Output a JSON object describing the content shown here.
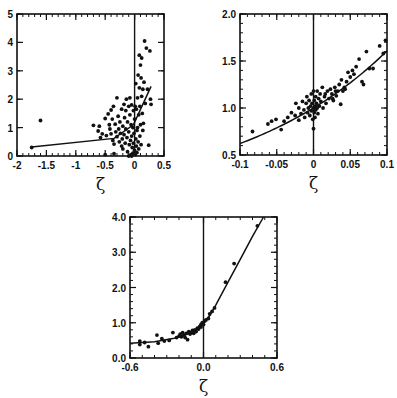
{
  "figure": {
    "width": 397,
    "height": 398,
    "ink_color": "#111111",
    "background": "#ffffff"
  },
  "chart_data": [
    {
      "type": "scatter",
      "panel": "top-left",
      "title": "",
      "xlabel": "ζ",
      "ylabel": "",
      "xlim": [
        -2,
        0.5
      ],
      "ylim": [
        0,
        5
      ],
      "xticks": [
        -2,
        -1.5,
        -1,
        -0.5,
        0,
        0.5
      ],
      "xtick_labels": [
        "-2",
        "-1.5",
        "-1",
        "-0.5",
        "0",
        "0.5"
      ],
      "xminor_step": 0.1,
      "yticks": [
        0,
        1,
        2,
        3,
        4,
        5
      ],
      "ytick_labels": [
        "0",
        "1",
        "2",
        "3",
        "4",
        "5"
      ],
      "yminor_step": 1,
      "grid": false,
      "vline_x": 0,
      "frame_px": {
        "x0": 17,
        "y0": 14,
        "x1": 164,
        "y1": 156
      },
      "fit_line": [
        [
          -1.75,
          0.32
        ],
        [
          -0.35,
          0.62
        ],
        [
          -0.02,
          1.1
        ],
        [
          0.28,
          2.45
        ]
      ],
      "points": [
        [
          -1.75,
          0.3
        ],
        [
          -1.6,
          1.25
        ],
        [
          -0.7,
          1.08
        ],
        [
          -0.62,
          0.88
        ],
        [
          -0.6,
          1.05
        ],
        [
          -0.58,
          0.65
        ],
        [
          -0.55,
          0.78
        ],
        [
          -0.5,
          1.32
        ],
        [
          -0.48,
          0.72
        ],
        [
          -0.45,
          1.48
        ],
        [
          -0.43,
          1.1
        ],
        [
          -0.42,
          0.95
        ],
        [
          -0.4,
          0.78
        ],
        [
          -0.4,
          1.62
        ],
        [
          -0.38,
          1.3
        ],
        [
          -0.37,
          0.55
        ],
        [
          -0.36,
          1.75
        ],
        [
          -0.35,
          0.42
        ],
        [
          -0.33,
          1.12
        ],
        [
          -0.32,
          0.85
        ],
        [
          -0.3,
          2.05
        ],
        [
          -0.3,
          0.68
        ],
        [
          -0.28,
          1.4
        ],
        [
          -0.27,
          0.95
        ],
        [
          -0.26,
          0.5
        ],
        [
          -0.25,
          1.2
        ],
        [
          -0.24,
          0.8
        ],
        [
          -0.22,
          1.65
        ],
        [
          -0.22,
          0.35
        ],
        [
          -0.21,
          0.6
        ],
        [
          -0.2,
          1.05
        ],
        [
          -0.2,
          0.25
        ],
        [
          -0.18,
          1.82
        ],
        [
          -0.18,
          0.75
        ],
        [
          -0.17,
          1.35
        ],
        [
          -0.16,
          0.45
        ],
        [
          -0.15,
          1.6
        ],
        [
          -0.15,
          0.95
        ],
        [
          -0.14,
          2.0
        ],
        [
          -0.13,
          0.65
        ],
        [
          -0.12,
          1.2
        ],
        [
          -0.12,
          0.15
        ],
        [
          -0.1,
          1.75
        ],
        [
          -0.1,
          0.85
        ],
        [
          -0.09,
          0.4
        ],
        [
          -0.08,
          2.05
        ],
        [
          -0.08,
          1.45
        ],
        [
          -0.07,
          0.55
        ],
        [
          -0.06,
          1.1
        ],
        [
          -0.06,
          0.05
        ],
        [
          -0.05,
          0.7
        ],
        [
          -0.05,
          1.8
        ],
        [
          -0.04,
          0.3
        ],
        [
          -0.03,
          1.0
        ],
        [
          -0.03,
          0.1
        ],
        [
          -0.02,
          1.6
        ],
        [
          -0.02,
          0.45
        ],
        [
          -0.01,
          0.8
        ],
        [
          0.0,
          0.2
        ],
        [
          0.0,
          1.3
        ],
        [
          0.01,
          0.05
        ],
        [
          0.01,
          1.75
        ],
        [
          0.02,
          0.6
        ],
        [
          0.02,
          2.55
        ],
        [
          0.03,
          0.35
        ],
        [
          0.03,
          1.65
        ],
        [
          0.04,
          0.9
        ],
        [
          0.04,
          0.12
        ],
        [
          0.05,
          2.05
        ],
        [
          0.05,
          1.0
        ],
        [
          0.06,
          0.5
        ],
        [
          0.06,
          2.85
        ],
        [
          0.07,
          1.45
        ],
        [
          0.07,
          0.25
        ],
        [
          0.08,
          3.55
        ],
        [
          0.08,
          2.4
        ],
        [
          0.09,
          1.75
        ],
        [
          0.09,
          0.7
        ],
        [
          0.1,
          3.2
        ],
        [
          0.1,
          1.1
        ],
        [
          0.11,
          2.75
        ],
        [
          0.11,
          0.4
        ],
        [
          0.12,
          3.45
        ],
        [
          0.12,
          2.1
        ],
        [
          0.13,
          1.5
        ],
        [
          0.14,
          2.35
        ],
        [
          0.14,
          0.9
        ],
        [
          0.15,
          1.15
        ],
        [
          0.16,
          2.6
        ],
        [
          0.17,
          4.05
        ],
        [
          0.18,
          1.85
        ],
        [
          0.2,
          3.8
        ],
        [
          0.22,
          2.35
        ],
        [
          0.24,
          0.38
        ],
        [
          0.26,
          3.7
        ],
        [
          0.27,
          2.0
        ],
        [
          0.28,
          1.82
        ],
        [
          -0.05,
          0.0
        ],
        [
          -0.1,
          0.0
        ],
        [
          -0.5,
          0.05
        ],
        [
          -0.35,
          0.08
        ]
      ]
    },
    {
      "type": "scatter",
      "panel": "top-right",
      "title": "",
      "xlabel": "ζ",
      "ylabel": "",
      "xlim": [
        -0.1,
        0.1
      ],
      "ylim": [
        0.5,
        2.0
      ],
      "xticks": [
        -0.1,
        -0.05,
        0,
        0.05,
        0.1
      ],
      "xtick_labels": [
        "-0.1",
        "-0.05",
        "0",
        "0.05",
        "0.1"
      ],
      "xminor_step": 0.01,
      "yticks": [
        0.5,
        1.0,
        1.5,
        2.0
      ],
      "ytick_labels": [
        "0.5",
        "1.0",
        "1.5",
        "2.0"
      ],
      "yminor_step": 0.1,
      "grid": false,
      "vline_x": 0,
      "frame_px": {
        "x0": 240,
        "y0": 14,
        "x1": 387,
        "y1": 155
      },
      "fit_curve": {
        "form": "exp",
        "a": 1.0,
        "b": 4.75,
        "x_from": -0.1,
        "x_to": 0.1
      },
      "points": [
        [
          -0.083,
          0.75
        ],
        [
          -0.062,
          0.83
        ],
        [
          -0.057,
          0.86
        ],
        [
          -0.051,
          0.88
        ],
        [
          -0.044,
          0.77
        ],
        [
          -0.04,
          0.86
        ],
        [
          -0.035,
          0.9
        ],
        [
          -0.03,
          0.95
        ],
        [
          -0.025,
          0.92
        ],
        [
          -0.02,
          1.0
        ],
        [
          -0.02,
          0.87
        ],
        [
          -0.017,
          0.94
        ],
        [
          -0.015,
          1.07
        ],
        [
          -0.013,
          0.98
        ],
        [
          -0.012,
          0.9
        ],
        [
          -0.01,
          1.05
        ],
        [
          -0.009,
          1.12
        ],
        [
          -0.008,
          0.95
        ],
        [
          -0.007,
          1.0
        ],
        [
          -0.006,
          1.08
        ],
        [
          -0.005,
          0.92
        ],
        [
          -0.004,
          1.02
        ],
        [
          -0.003,
          1.15
        ],
        [
          -0.003,
          0.97
        ],
        [
          -0.002,
          1.05
        ],
        [
          -0.001,
          0.88
        ],
        [
          0.0,
          1.0
        ],
        [
          0.0,
          0.78
        ],
        [
          0.0,
          1.18
        ],
        [
          0.001,
          0.95
        ],
        [
          0.001,
          1.08
        ],
        [
          0.002,
          1.02
        ],
        [
          0.002,
          0.9
        ],
        [
          0.003,
          1.12
        ],
        [
          0.003,
          0.98
        ],
        [
          0.004,
          1.05
        ],
        [
          0.005,
          1.0
        ],
        [
          0.005,
          1.18
        ],
        [
          0.006,
          0.94
        ],
        [
          0.007,
          1.1
        ],
        [
          0.008,
          1.02
        ],
        [
          0.009,
          1.15
        ],
        [
          0.01,
          1.07
        ],
        [
          0.012,
          1.22
        ],
        [
          0.013,
          1.0
        ],
        [
          0.015,
          1.12
        ],
        [
          0.017,
          1.05
        ],
        [
          0.019,
          1.18
        ],
        [
          0.021,
          1.1
        ],
        [
          0.023,
          1.2
        ],
        [
          0.025,
          1.15
        ],
        [
          0.027,
          1.08
        ],
        [
          0.029,
          1.22
        ],
        [
          0.031,
          1.13
        ],
        [
          0.033,
          1.18
        ],
        [
          0.035,
          1.25
        ],
        [
          0.037,
          1.04
        ],
        [
          0.038,
          1.3
        ],
        [
          0.04,
          1.18
        ],
        [
          0.042,
          1.22
        ],
        [
          0.045,
          1.28
        ],
        [
          0.047,
          1.38
        ],
        [
          0.05,
          1.33
        ],
        [
          0.053,
          1.4
        ],
        [
          0.055,
          1.36
        ],
        [
          0.058,
          1.44
        ],
        [
          0.062,
          1.52
        ],
        [
          0.066,
          1.28
        ],
        [
          0.068,
          1.25
        ],
        [
          0.072,
          1.6
        ],
        [
          0.076,
          1.42
        ],
        [
          0.081,
          1.42
        ],
        [
          0.09,
          1.66
        ],
        [
          0.095,
          1.58
        ],
        [
          0.098,
          1.72
        ],
        [
          0.026,
          1.1
        ],
        [
          0.03,
          1.18
        ],
        [
          0.016,
          1.15
        ],
        [
          0.043,
          1.2
        ],
        [
          -0.024,
          1.05
        ]
      ]
    },
    {
      "type": "scatter",
      "panel": "bottom-center",
      "title": "",
      "xlabel": "ζ",
      "ylabel": "",
      "xlim": [
        -0.6,
        0.6
      ],
      "ylim": [
        0.0,
        4.0
      ],
      "xticks": [
        -0.6,
        0.0,
        0.6
      ],
      "xtick_labels": [
        "-0.6",
        "0.0",
        "0.6"
      ],
      "xminor_step": 0.1,
      "yticks": [
        0.0,
        1.0,
        2.0,
        3.0,
        4.0
      ],
      "ytick_labels": [
        "0.0",
        "1.0",
        "2.0",
        "3.0",
        "4.0"
      ],
      "yminor_step": 0.2,
      "grid": false,
      "vline_x": 0,
      "frame_px": {
        "x0": 130,
        "y0": 217,
        "x1": 277,
        "y1": 358
      },
      "fit_line": [
        [
          -0.6,
          0.42
        ],
        [
          -0.4,
          0.46
        ],
        [
          -0.25,
          0.55
        ],
        [
          -0.15,
          0.65
        ],
        [
          -0.08,
          0.76
        ],
        [
          -0.03,
          0.88
        ],
        [
          0.0,
          1.0
        ],
        [
          0.05,
          1.2
        ],
        [
          0.1,
          1.5
        ],
        [
          0.2,
          2.15
        ],
        [
          0.3,
          2.8
        ],
        [
          0.4,
          3.45
        ],
        [
          0.49,
          4.0
        ]
      ],
      "points": [
        [
          -0.52,
          0.48
        ],
        [
          -0.52,
          0.38
        ],
        [
          -0.48,
          0.44
        ],
        [
          -0.45,
          0.32
        ],
        [
          -0.38,
          0.65
        ],
        [
          -0.37,
          0.42
        ],
        [
          -0.34,
          0.55
        ],
        [
          -0.32,
          0.48
        ],
        [
          -0.28,
          0.5
        ],
        [
          -0.25,
          0.72
        ],
        [
          -0.22,
          0.58
        ],
        [
          -0.2,
          0.62
        ],
        [
          -0.19,
          0.68
        ],
        [
          -0.18,
          0.6
        ],
        [
          -0.17,
          0.72
        ],
        [
          -0.16,
          0.65
        ],
        [
          -0.15,
          0.58
        ],
        [
          -0.14,
          0.7
        ],
        [
          -0.13,
          0.52
        ],
        [
          -0.12,
          0.75
        ],
        [
          -0.11,
          0.68
        ],
        [
          -0.1,
          0.72
        ],
        [
          -0.09,
          0.78
        ],
        [
          -0.08,
          0.7
        ],
        [
          -0.07,
          0.8
        ],
        [
          -0.06,
          0.75
        ],
        [
          -0.05,
          0.85
        ],
        [
          -0.04,
          0.82
        ],
        [
          -0.03,
          0.9
        ],
        [
          -0.02,
          0.95
        ],
        [
          -0.02,
          0.88
        ],
        [
          -0.01,
          1.0
        ],
        [
          0.0,
          0.95
        ],
        [
          0.01,
          1.05
        ],
        [
          0.02,
          1.08
        ],
        [
          0.04,
          1.12
        ],
        [
          0.05,
          1.25
        ],
        [
          0.07,
          1.32
        ],
        [
          0.09,
          1.42
        ],
        [
          0.18,
          2.15
        ],
        [
          0.25,
          2.68
        ],
        [
          0.44,
          3.75
        ]
      ]
    }
  ]
}
